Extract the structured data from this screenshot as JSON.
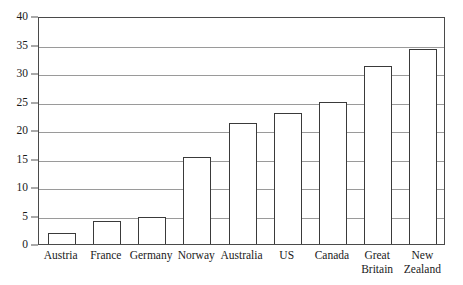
{
  "chart_data": {
    "type": "bar",
    "title": "",
    "subtitle": "",
    "xlabel": "",
    "ylabel": "",
    "categories": [
      "Austria",
      "France",
      "Germany",
      "Norway",
      "Australia",
      "US",
      "Canada",
      "Great Britain",
      "New Zealand"
    ],
    "values": [
      1.9,
      4.0,
      4.8,
      15.3,
      21.3,
      23.0,
      25.0,
      31.2,
      34.3
    ],
    "ylim": [
      0,
      40
    ],
    "ytick_labels": [
      "0",
      "5",
      "10",
      "15",
      "20",
      "25",
      "30",
      "35",
      "40"
    ],
    "ytick_values": [
      0,
      5,
      10,
      15,
      20,
      25,
      30,
      35,
      40
    ],
    "grid": true,
    "grid_axis": "y",
    "legend": false,
    "legend_position": "none",
    "annotations": [],
    "bar_fill_color": "#ffffff",
    "bar_edge_color": "#3a3a3a",
    "gridline_color": "#9a9a9a",
    "frame_color": "#4a4a4a",
    "background_color": "#ffffff"
  }
}
